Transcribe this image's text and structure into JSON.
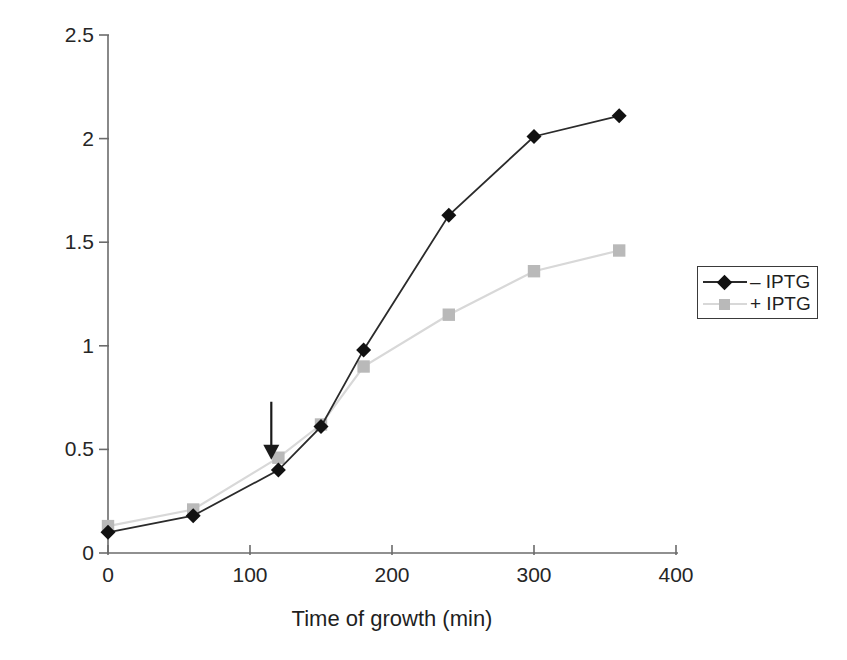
{
  "chart_data": {
    "type": "line",
    "title": "",
    "xlabel": "Time of growth (min)",
    "ylabel": "Absorbance",
    "ylabel_subscript": "680nm",
    "xlim": [
      0,
      400
    ],
    "ylim": [
      0,
      2.5
    ],
    "x_ticks": [
      0,
      100,
      200,
      300,
      400
    ],
    "x_tick_labels": [
      "0",
      "100",
      "200",
      "300",
      "400"
    ],
    "y_ticks": [
      0,
      0.5,
      1,
      1.5,
      2,
      2.5
    ],
    "y_tick_labels": [
      "0",
      "0.5",
      "1",
      "1.5",
      "2",
      "2.5"
    ],
    "grid": false,
    "legend_position": "right",
    "x": [
      0,
      60,
      120,
      150,
      180,
      240,
      300,
      360
    ],
    "series": [
      {
        "name": "– IPTG",
        "marker": "diamond",
        "color": "#111111",
        "line_color": "#2b2b2b",
        "values": [
          0.1,
          0.18,
          0.4,
          0.61,
          0.98,
          1.63,
          2.01,
          2.11
        ]
      },
      {
        "name": "+ IPTG",
        "marker": "square",
        "color": "#b9b9b9",
        "line_color": "#d8d8d8",
        "values": [
          0.13,
          0.21,
          0.46,
          0.62,
          0.9,
          1.15,
          1.36,
          1.46
        ]
      }
    ],
    "annotations": [
      {
        "type": "arrow",
        "label": "",
        "x": 115,
        "y_from": 0.73,
        "y_to": 0.45,
        "color": "#1a1a1a"
      }
    ]
  },
  "legend": {
    "entries": [
      {
        "label": "– IPTG"
      },
      {
        "label": "+ IPTG"
      }
    ]
  },
  "axes": {
    "axis_color": "#6b6b6b"
  }
}
